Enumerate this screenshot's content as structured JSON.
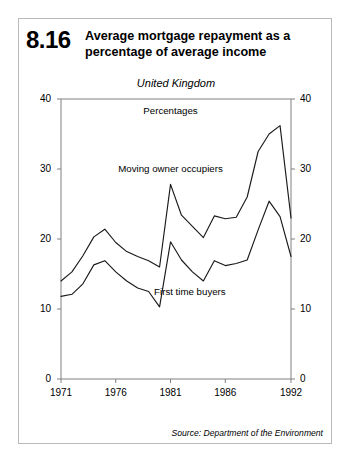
{
  "figure": {
    "number": "8.16",
    "title": "Average mortgage repayment as a percentage of average income",
    "subtitle": "United Kingdom",
    "source": "Source: Department of the Environment"
  },
  "colors": {
    "line": "#1a1a1a",
    "axis": "#808080",
    "border": "#b9b9b9",
    "background": "#ffffff",
    "text": "#000000"
  },
  "chart_data": {
    "type": "line",
    "title": "Average mortgage repayment as a percentage of average income",
    "subtitle": "United Kingdom",
    "unit_label": "Percentages",
    "xlabel": "",
    "ylabel": "",
    "xlim": [
      1971,
      1992
    ],
    "ylim": [
      0,
      40
    ],
    "xticks": [
      1971,
      1976,
      1981,
      1986,
      1992
    ],
    "xtick_labels": [
      "1971",
      "1976",
      "1981",
      "1986",
      "1992"
    ],
    "yticks": [
      0,
      10,
      20,
      30,
      40
    ],
    "ytick_labels": [
      "0",
      "10",
      "20",
      "30",
      "40"
    ],
    "y_axis_both_sides": true,
    "grid": false,
    "legend": "inline-annotations",
    "x": [
      1971,
      1972,
      1973,
      1974,
      1975,
      1976,
      1977,
      1978,
      1979,
      1980,
      1981,
      1982,
      1983,
      1984,
      1985,
      1986,
      1987,
      1988,
      1989,
      1990,
      1991,
      1992
    ],
    "series": [
      {
        "name": "Moving owner occupiers",
        "values": [
          14.0,
          15.3,
          17.6,
          20.3,
          21.4,
          19.5,
          18.2,
          17.5,
          16.9,
          16.0,
          27.8,
          23.4,
          21.8,
          20.2,
          23.3,
          22.9,
          23.1,
          26.0,
          32.5,
          35.0,
          36.2,
          23.0
        ]
      },
      {
        "name": "First time buyers",
        "values": [
          11.8,
          12.1,
          13.6,
          16.3,
          16.9,
          15.3,
          14.0,
          13.0,
          12.5,
          10.3,
          19.6,
          17.0,
          15.3,
          14.0,
          16.9,
          16.2,
          16.5,
          17.0,
          21.3,
          25.4,
          23.2,
          17.5
        ]
      }
    ],
    "annotations": [
      {
        "text": "Percentages",
        "x": 1981,
        "y": 38.3
      },
      {
        "text": "Moving owner occupiers",
        "x": 1981,
        "y": 30.0
      },
      {
        "text": "First time buyers",
        "x": 1979.5,
        "y": 12.5
      }
    ]
  }
}
